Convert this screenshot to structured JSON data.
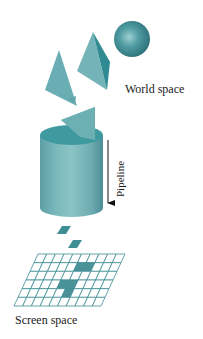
{
  "figure": {
    "labels": {
      "world_space": "World space",
      "pipeline": "Pipeline",
      "screen_space": "Screen space"
    },
    "colors": {
      "background": "#ffffff",
      "shape_light": "#7fbcc0",
      "shape_mid": "#5fa5ab",
      "shape_dark": "#2f8a92",
      "cylinder_top": "#3f9aa0",
      "grid_line": "#3f8e96",
      "grid_fill": "#4a9298",
      "arrow": "#111111"
    },
    "world_space_objects": [
      "triangle",
      "tetrahedron",
      "sphere",
      "triangle",
      "cylinder"
    ],
    "screen_grid": {
      "columns": 10,
      "rows": 6,
      "filled_cells": [
        [
          1,
          5
        ],
        [
          1,
          6
        ],
        [
          3,
          4
        ],
        [
          3,
          5
        ],
        [
          4,
          5
        ]
      ]
    },
    "falling_fragments": 2
  }
}
